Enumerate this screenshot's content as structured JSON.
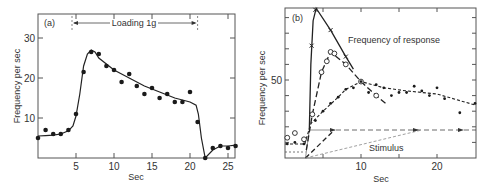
{
  "chart_data": [
    {
      "type": "scatter",
      "panel_label": "(a)",
      "title": "",
      "xlabel": "Sec",
      "ylabel": "Frequency per sec",
      "xlim": [
        0,
        26
      ],
      "ylim": [
        0,
        30
      ],
      "xticks": [
        5,
        10,
        15,
        20,
        25
      ],
      "yticks": [
        10,
        20,
        30
      ],
      "annotation": {
        "text": "Loading 1g",
        "x_start": 4.5,
        "x_end": 21
      },
      "series": [
        {
          "name": "observed",
          "marker": "filled-circle",
          "x": [
            0,
            1,
            2,
            3,
            4,
            5,
            6,
            7,
            8,
            9,
            10,
            11,
            12,
            13,
            14,
            15,
            16,
            17,
            18,
            19,
            20,
            21,
            22,
            23,
            24,
            25,
            26
          ],
          "y": [
            5,
            7,
            6,
            6,
            7,
            11,
            21.5,
            26.5,
            26,
            23,
            22,
            19,
            21,
            18,
            16,
            17.5,
            15,
            16,
            14,
            14,
            16.5,
            9,
            0,
            2.5,
            3,
            2.5,
            3
          ]
        },
        {
          "name": "fitted curve",
          "marker": "line",
          "x": [
            0,
            1,
            2,
            3,
            4,
            4.6,
            5,
            5.5,
            6,
            6.5,
            7,
            7.5,
            8,
            10,
            12,
            14,
            16,
            18,
            20,
            20.8,
            21.1,
            21.5,
            22,
            23,
            24,
            25,
            26
          ],
          "y": [
            5.5,
            5.6,
            5.7,
            6,
            6.8,
            8,
            10.5,
            16,
            23,
            26,
            27,
            26.5,
            25,
            22,
            20,
            18,
            16.5,
            15,
            14,
            13.2,
            11,
            5,
            0,
            2,
            3,
            3,
            3.2
          ]
        }
      ]
    },
    {
      "type": "scatter",
      "panel_label": "(b)",
      "title": "",
      "xlabel": "Sec",
      "ylabel": "Frequency per sec",
      "xlim": [
        0,
        25
      ],
      "ylim": [
        0,
        96
      ],
      "xticks": [
        10,
        20
      ],
      "yticks": [
        50
      ],
      "annotations": [
        {
          "text": "Frequency of response",
          "x": 8.5,
          "y": 78
        },
        {
          "text": "Stimulus",
          "x": 12,
          "y": 6
        }
      ],
      "series": [
        {
          "name": "response (x)",
          "marker": "cross",
          "x": [
            3.5,
            4.0,
            6.0,
            8.0
          ],
          "y": [
            72,
            95,
            82,
            65
          ]
        },
        {
          "name": "response (o)",
          "marker": "open-circle",
          "x": [
            0.3,
            1.3,
            2.5,
            3.6,
            4.8,
            5.5,
            6.0,
            6.5,
            8.0,
            10.0,
            12.0
          ],
          "y": [
            13,
            16,
            12,
            28,
            55,
            62,
            68,
            67,
            60,
            49,
            40
          ]
        },
        {
          "name": "response (dot)",
          "marker": "small-dot",
          "x": [
            0.3,
            1.3,
            2.5,
            4,
            5,
            6,
            7,
            8,
            9,
            10,
            11,
            12,
            13,
            14,
            15,
            16,
            17,
            18,
            19,
            20,
            21,
            23,
            25
          ],
          "y": [
            9,
            10,
            9,
            24,
            30,
            35,
            39,
            44,
            45,
            49,
            42,
            47,
            45,
            40,
            42,
            42,
            46,
            43,
            40,
            45,
            38,
            29,
            35
          ]
        },
        {
          "name": "stimulus",
          "marker": "line",
          "x": [
            2.7,
            3.2,
            25
          ],
          "y": [
            0,
            18,
            18
          ]
        }
      ]
    }
  ],
  "panels": {
    "a": {
      "label": "(a)",
      "xlabel": "Sec",
      "ylabel": "Frequency per sec",
      "annotation": "Loading 1g",
      "xtick_labels": [
        "5",
        "10",
        "15",
        "20",
        "25"
      ],
      "ytick_labels": [
        "10",
        "20",
        "30"
      ]
    },
    "b": {
      "label": "(b)",
      "xlabel": "Sec",
      "ylabel": "Frequency per sec",
      "response_label": "Frequency of response",
      "stimulus_label": "Stimulus",
      "xtick_labels": [
        "10",
        "20"
      ],
      "ytick_labels": [
        "50"
      ]
    }
  }
}
